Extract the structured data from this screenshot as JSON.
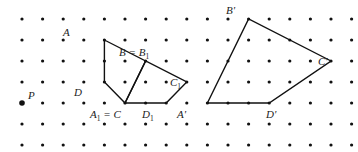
{
  "grid": {
    "cols": 17,
    "rows": 7,
    "x0": 22,
    "y0": 19,
    "dx": 20.6,
    "dy": 21
  },
  "colors": {
    "ink": "#111111",
    "background": "#ffffff"
  },
  "center": {
    "label": "P",
    "col": 0,
    "row": 4
  },
  "shapes": [
    {
      "name": "original-quadrilateral",
      "points": [
        {
          "label": "A",
          "col": 4,
          "row": 1
        },
        {
          "label": "B = B₁",
          "col": 6,
          "row": 2
        },
        {
          "label": "C",
          "col": 5,
          "row": 4
        },
        {
          "label": "D",
          "col": 4,
          "row": 3
        }
      ]
    },
    {
      "name": "rotated-quadrilateral",
      "points": [
        {
          "label": "A₁ = C",
          "col": 5,
          "row": 4
        },
        {
          "label": "B₁",
          "col": 6,
          "row": 2
        },
        {
          "label": "C₁",
          "col": 8,
          "row": 3
        },
        {
          "label": "D₁",
          "col": 7,
          "row": 4
        }
      ]
    },
    {
      "name": "enlarged-quadrilateral",
      "points": [
        {
          "label": "A'",
          "col": 9,
          "row": 4
        },
        {
          "label": "B'",
          "col": 11,
          "row": 0
        },
        {
          "label": "C'",
          "col": 15,
          "row": 2
        },
        {
          "label": "D'",
          "col": 12,
          "row": 4
        }
      ]
    }
  ],
  "labels": {
    "A": "A",
    "B_eq": "B = B",
    "B_sub": "1",
    "C1": "C",
    "C1_sub": "1",
    "D": "D",
    "A1_main": "A",
    "A1_sub": "1",
    "A1_rest": " = C",
    "D1": "D",
    "D1_sub": "1",
    "P": "P",
    "A_prime": "A'",
    "B_prime": "B'",
    "C_prime": "C'",
    "D_prime": "D'"
  }
}
